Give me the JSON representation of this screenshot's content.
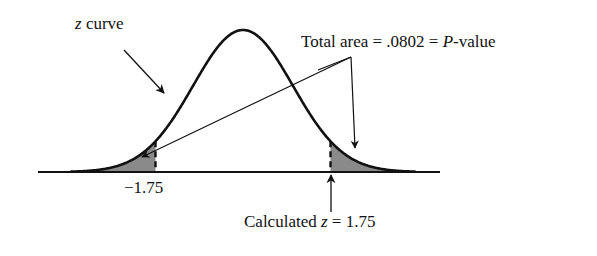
{
  "chart_data": {
    "type": "area",
    "title": "",
    "xlabel": "",
    "ylabel": "",
    "tick_labels": [
      "-1.75"
    ],
    "critical_values": [
      -1.75,
      1.75
    ],
    "shaded_regions": [
      {
        "from": "-inf",
        "to": -1.75
      },
      {
        "from": 1.75,
        "to": "inf"
      }
    ],
    "total_shaded_area": 0.0802,
    "annotations": [
      {
        "text_italic": "z",
        "text": " curve",
        "points_to": "curve"
      },
      {
        "text": "Total area = .0802 = ",
        "text_italic": "P",
        "text_suffix": "-value",
        "points_to": "both shaded tails"
      },
      {
        "text": "Calculated ",
        "text_italic": "z",
        "text_suffix": " = 1.75",
        "points_to": "z = 1.75"
      }
    ],
    "grid": false,
    "legend": "none"
  },
  "labels": {
    "zcurve_italic": "z",
    "zcurve_rest": " curve",
    "area_prefix": "Total area = .0802 = ",
    "area_italic": "P",
    "area_suffix": "-value",
    "left_tick": "−1.75",
    "calc_prefix": "Calculated ",
    "calc_italic": "z",
    "calc_suffix": " = 1.75"
  },
  "colors": {
    "ink": "#111111",
    "shade": "#8a8a8a",
    "background": "#ffffff"
  }
}
